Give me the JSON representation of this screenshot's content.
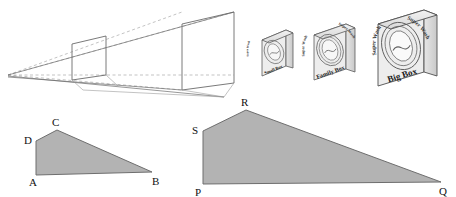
{
  "figure": {
    "background_color": "#ffffff",
    "fill_color": "#b3b3b3",
    "stroke_color": "#555555",
    "label_color": "#111111"
  },
  "perspective": {
    "name": "perspective-cone",
    "vanishing_point": {
      "x": 8,
      "y": 75
    },
    "near_rect": {
      "x": 72,
      "y": 37,
      "w": 34,
      "h": 40
    },
    "far_rect": {
      "x": 182,
      "y": 12,
      "w": 52,
      "h": 78
    },
    "horizon_visible": true
  },
  "boxes": [
    {
      "name": "small-box",
      "front_label": "Small Box",
      "brand_label": "Super Wash",
      "size": "small",
      "x": 262,
      "y": 30,
      "w": 30,
      "h": 45
    },
    {
      "name": "family-box",
      "front_label": "Family Box",
      "brand_label": "Super Wash",
      "size": "medium",
      "x": 316,
      "y": 24,
      "w": 40,
      "h": 56
    },
    {
      "name": "big-box",
      "front_label": "Big Box",
      "brand_label": "Super Wash",
      "size": "large",
      "x": 380,
      "y": 10,
      "w": 58,
      "h": 76
    }
  ],
  "quadrilaterals": [
    {
      "name": "quadrilateral-abcd",
      "vertices": [
        {
          "label": "A",
          "x": 36,
          "y": 175,
          "label_x": 29,
          "label_y": 186
        },
        {
          "label": "B",
          "x": 152,
          "y": 172,
          "label_x": 153,
          "label_y": 185
        },
        {
          "label": "C",
          "x": 57,
          "y": 130,
          "label_x": 53,
          "label_y": 126
        },
        {
          "label": "D",
          "x": 36,
          "y": 141,
          "label_x": 26,
          "label_y": 143
        }
      ],
      "path_order": [
        "A",
        "D",
        "C",
        "B"
      ]
    },
    {
      "name": "quadrilateral-pqrs",
      "vertices": [
        {
          "label": "P",
          "x": 203,
          "y": 184,
          "label_x": 196,
          "label_y": 195
        },
        {
          "label": "Q",
          "x": 441,
          "y": 182,
          "label_x": 440,
          "label_y": 194
        },
        {
          "label": "R",
          "x": 246,
          "y": 110,
          "label_x": 241,
          "label_y": 105
        },
        {
          "label": "S",
          "x": 203,
          "y": 131,
          "label_x": 193,
          "label_y": 133
        }
      ],
      "path_order": [
        "P",
        "S",
        "R",
        "Q"
      ]
    }
  ]
}
